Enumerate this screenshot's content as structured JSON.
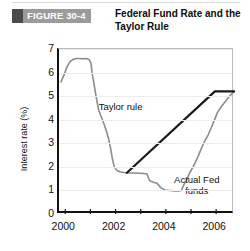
{
  "figure": {
    "badge_label": "FIGURE 30-4",
    "title": "Federal Fund Rate and the Taylor Rule",
    "badge_bg": "#9b9b9b",
    "badge_block_color": "#4a4a4a"
  },
  "chart_data": {
    "type": "line",
    "title": "Federal Fund Rate and the Taylor Rule",
    "xlabel": "",
    "ylabel": "Interest rate (%)",
    "xlim": [
      1999.75,
      2006.75
    ],
    "ylim": [
      0,
      7
    ],
    "yticks": [
      0,
      1,
      2,
      3,
      4,
      5,
      6,
      7
    ],
    "xticks": [
      2000,
      2002,
      2004,
      2006
    ],
    "xtick_labels": [
      "2000",
      "2002",
      "2004",
      "2006"
    ],
    "minor_xticks": [
      2001,
      2003,
      2005
    ],
    "grid": "horizontal",
    "legend": "inline-annotations",
    "annotations": [
      {
        "text": "Taylor rule",
        "x": 2002.6,
        "y": 4.55
      },
      {
        "text": "Actual Fed",
        "x": 2005.4,
        "y": 1.45
      },
      {
        "text": "funds",
        "x": 2005.4,
        "y": 1.05
      }
    ],
    "series": [
      {
        "name": "Actual Fed funds",
        "color": "#8c8c8c",
        "width": 1.6,
        "points": [
          [
            1999.83,
            5.6
          ],
          [
            1999.95,
            5.9
          ],
          [
            2000.05,
            6.2
          ],
          [
            2000.18,
            6.45
          ],
          [
            2000.3,
            6.55
          ],
          [
            2000.45,
            6.6
          ],
          [
            2000.6,
            6.6
          ],
          [
            2000.72,
            6.58
          ],
          [
            2000.85,
            6.6
          ],
          [
            2000.95,
            6.55
          ],
          [
            2001.02,
            6.4
          ],
          [
            2001.08,
            5.9
          ],
          [
            2001.16,
            5.4
          ],
          [
            2001.24,
            4.9
          ],
          [
            2001.33,
            4.4
          ],
          [
            2001.4,
            4.2
          ],
          [
            2001.48,
            4.0
          ],
          [
            2001.56,
            3.75
          ],
          [
            2001.64,
            3.5
          ],
          [
            2001.72,
            3.2
          ],
          [
            2001.8,
            2.8
          ],
          [
            2001.88,
            2.3
          ],
          [
            2001.95,
            2.0
          ],
          [
            2002.05,
            1.85
          ],
          [
            2002.2,
            1.78
          ],
          [
            2002.4,
            1.75
          ],
          [
            2002.55,
            1.74
          ],
          [
            2002.75,
            1.74
          ],
          [
            2002.95,
            1.73
          ],
          [
            2003.1,
            1.72
          ],
          [
            2003.25,
            1.7
          ],
          [
            2003.35,
            1.42
          ],
          [
            2003.5,
            1.35
          ],
          [
            2003.65,
            1.3
          ],
          [
            2003.8,
            1.12
          ],
          [
            2003.95,
            1.02
          ],
          [
            2004.15,
            1.0
          ],
          [
            2004.35,
            0.98
          ],
          [
            2004.5,
            0.98
          ],
          [
            2004.62,
            1.0
          ],
          [
            2004.72,
            1.25
          ],
          [
            2004.85,
            1.5
          ],
          [
            2004.95,
            1.75
          ],
          [
            2005.08,
            2.0
          ],
          [
            2005.2,
            2.25
          ],
          [
            2005.3,
            2.5
          ],
          [
            2005.42,
            2.8
          ],
          [
            2005.55,
            3.1
          ],
          [
            2005.68,
            3.35
          ],
          [
            2005.8,
            3.65
          ],
          [
            2005.92,
            3.95
          ],
          [
            2006.05,
            4.3
          ],
          [
            2006.2,
            4.55
          ],
          [
            2006.35,
            4.75
          ],
          [
            2006.5,
            4.95
          ],
          [
            2006.62,
            5.1
          ],
          [
            2006.72,
            5.2
          ]
        ]
      },
      {
        "name": "Taylor rule",
        "color": "#1a1a1a",
        "width": 2.2,
        "points": [
          [
            2002.45,
            1.75
          ],
          [
            2005.95,
            5.2
          ],
          [
            2006.72,
            5.2
          ]
        ]
      }
    ]
  }
}
